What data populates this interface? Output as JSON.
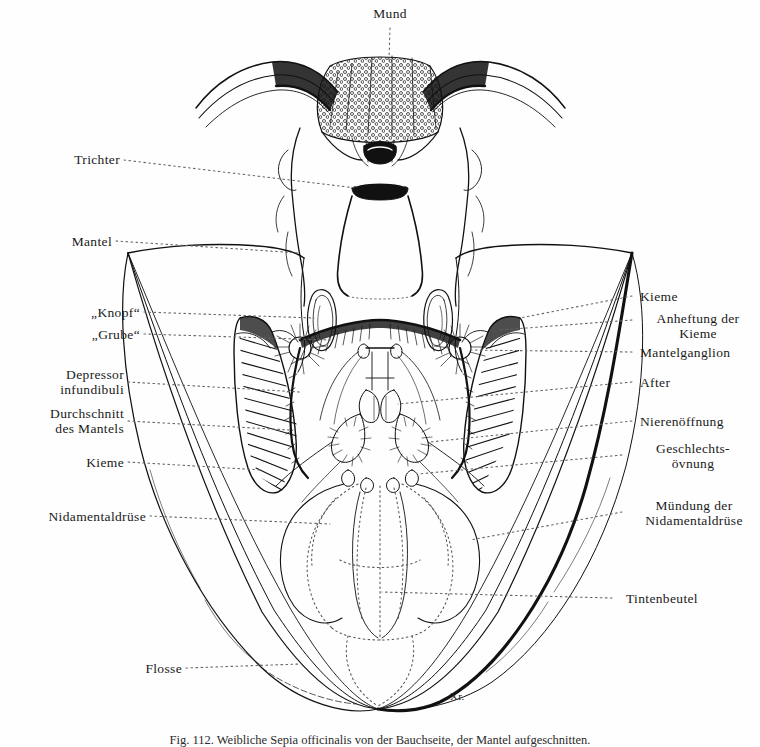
{
  "figure": {
    "title": "Mund",
    "signature": "Xr.",
    "caption": "Fig. 112.  Weibliche Sepia officinalis von der Bauchseite, der Mantel aufgeschnitten.",
    "ink_color": "#111111",
    "paper_color": "#ffffff"
  },
  "labels_left": [
    {
      "id": "trichter",
      "text": "Trichter"
    },
    {
      "id": "mantel",
      "text": "Mantel"
    },
    {
      "id": "knopf",
      "text": "„Knopf“"
    },
    {
      "id": "grube",
      "text": "„Grube“"
    },
    {
      "id": "depressor",
      "text": "Depressor\ninfundibuli"
    },
    {
      "id": "durchschnitt",
      "text": "Durchschnitt\ndes Mantels"
    },
    {
      "id": "kieme-l",
      "text": "Kieme"
    },
    {
      "id": "nidamental",
      "text": "Nidamentaldrüse"
    },
    {
      "id": "flosse",
      "text": "Flosse"
    }
  ],
  "labels_right": [
    {
      "id": "kieme-r",
      "text": "Kieme"
    },
    {
      "id": "anheftung",
      "text": "Anheftung der\nKieme"
    },
    {
      "id": "mantelganglion",
      "text": "Mantelganglion"
    },
    {
      "id": "after",
      "text": "After"
    },
    {
      "id": "nierenoeffnung",
      "text": "Nierenöffnung"
    },
    {
      "id": "geschlecht",
      "text": "Geschlechts-\növnung"
    },
    {
      "id": "muendung",
      "text": "Mündung der\nNidamentaldrüse"
    },
    {
      "id": "tintenbeutel",
      "text": "Tintenbeutel"
    }
  ],
  "labels_top": [
    {
      "id": "mund",
      "text": "Mund"
    }
  ]
}
